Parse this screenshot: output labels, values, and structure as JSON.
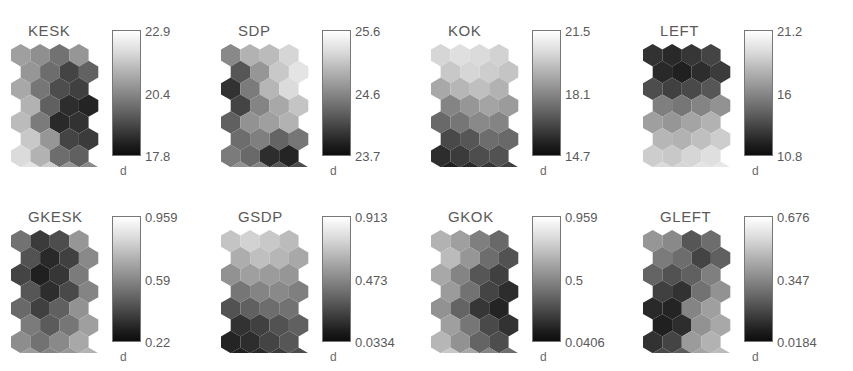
{
  "figure": {
    "type": "som-component-planes",
    "unit_label": "d",
    "colormap": "grayscale-inverted",
    "rows": 2,
    "cols": 4
  },
  "chart_data": {
    "type": "heatmap",
    "title": "",
    "xlabel": "",
    "ylabel": "",
    "colorbar_unit": "d",
    "colormap": "gray (high = light, low = dark)",
    "grid_shape": "hexagonal",
    "map_rows": 8,
    "map_cols": 4,
    "panels": [
      {
        "label": "KESK",
        "unit": "d",
        "ticks": [
          "22.9",
          "20.4",
          "17.8"
        ],
        "vmin": 17.8,
        "vmax": 22.9,
        "vmid": 20.4,
        "values": [
          [
            0.62,
            0.55,
            0.42,
            0.58
          ],
          [
            0.58,
            0.4,
            0.22,
            0.35
          ],
          [
            0.66,
            0.44,
            0.26,
            0.2
          ],
          [
            0.7,
            0.34,
            0.12,
            0.08
          ],
          [
            0.74,
            0.46,
            0.1,
            0.14
          ],
          [
            0.8,
            0.58,
            0.22,
            0.18
          ],
          [
            0.88,
            0.7,
            0.4,
            0.34
          ],
          [
            0.92,
            0.82,
            0.58,
            0.52
          ]
        ]
      },
      {
        "label": "SDP",
        "unit": "d",
        "ticks": [
          "25.6",
          "24.6",
          "23.7"
        ],
        "vmin": 23.7,
        "vmax": 25.6,
        "vmid": 24.6,
        "values": [
          [
            0.52,
            0.7,
            0.74,
            0.86
          ],
          [
            0.3,
            0.58,
            0.8,
            0.92
          ],
          [
            0.14,
            0.46,
            0.72,
            0.88
          ],
          [
            0.22,
            0.5,
            0.66,
            0.78
          ],
          [
            0.34,
            0.56,
            0.62,
            0.7
          ],
          [
            0.4,
            0.48,
            0.36,
            0.44
          ],
          [
            0.46,
            0.38,
            0.12,
            0.08
          ],
          [
            0.56,
            0.5,
            0.3,
            0.26
          ]
        ]
      },
      {
        "label": "KOK",
        "unit": "d",
        "ticks": [
          "21.5",
          "18.1",
          "14.7"
        ],
        "vmin": 14.7,
        "vmax": 21.5,
        "vmid": 18.1,
        "values": [
          [
            0.86,
            0.9,
            0.88,
            0.84
          ],
          [
            0.8,
            0.86,
            0.82,
            0.78
          ],
          [
            0.66,
            0.72,
            0.76,
            0.7
          ],
          [
            0.5,
            0.58,
            0.64,
            0.6
          ],
          [
            0.38,
            0.44,
            0.52,
            0.5
          ],
          [
            0.24,
            0.3,
            0.4,
            0.38
          ],
          [
            0.12,
            0.18,
            0.26,
            0.28
          ],
          [
            0.06,
            0.1,
            0.16,
            0.2
          ]
        ]
      },
      {
        "label": "LEFT",
        "unit": "d",
        "ticks": [
          "21.2",
          "16",
          "10.8"
        ],
        "vmin": 10.8,
        "vmax": 21.2,
        "vmid": 16,
        "values": [
          [
            0.14,
            0.1,
            0.16,
            0.22
          ],
          [
            0.1,
            0.06,
            0.12,
            0.18
          ],
          [
            0.26,
            0.2,
            0.24,
            0.3
          ],
          [
            0.48,
            0.44,
            0.5,
            0.56
          ],
          [
            0.62,
            0.58,
            0.64,
            0.7
          ],
          [
            0.72,
            0.7,
            0.76,
            0.82
          ],
          [
            0.82,
            0.8,
            0.86,
            0.9
          ],
          [
            0.88,
            0.86,
            0.92,
            0.94
          ]
        ]
      },
      {
        "label": "GKESK",
        "unit": "d",
        "ticks": [
          "0.959",
          "0.59",
          "0.22"
        ],
        "vmin": 0.22,
        "vmax": 0.959,
        "vmid": 0.59,
        "values": [
          [
            0.42,
            0.18,
            0.26,
            0.58
          ],
          [
            0.28,
            0.1,
            0.2,
            0.52
          ],
          [
            0.22,
            0.06,
            0.16,
            0.46
          ],
          [
            0.3,
            0.12,
            0.24,
            0.5
          ],
          [
            0.38,
            0.2,
            0.34,
            0.56
          ],
          [
            0.46,
            0.32,
            0.44,
            0.62
          ],
          [
            0.54,
            0.42,
            0.52,
            0.66
          ],
          [
            0.6,
            0.5,
            0.58,
            0.7
          ]
        ]
      },
      {
        "label": "GSDP",
        "unit": "d",
        "ticks": [
          "0.913",
          "0.473",
          "0.0334"
        ],
        "vmin": 0.0334,
        "vmax": 0.913,
        "vmid": 0.473,
        "values": [
          [
            0.78,
            0.84,
            0.8,
            0.74
          ],
          [
            0.68,
            0.76,
            0.72,
            0.66
          ],
          [
            0.56,
            0.62,
            0.6,
            0.58
          ],
          [
            0.44,
            0.5,
            0.52,
            0.48
          ],
          [
            0.28,
            0.34,
            0.4,
            0.42
          ],
          [
            0.14,
            0.2,
            0.28,
            0.34
          ],
          [
            0.08,
            0.12,
            0.22,
            0.3
          ],
          [
            0.06,
            0.1,
            0.18,
            0.26
          ]
        ]
      },
      {
        "label": "GKOK",
        "unit": "d",
        "ticks": [
          "0.959",
          "0.5",
          "0.0406"
        ],
        "vmin": 0.0406,
        "vmax": 0.959,
        "vmid": 0.5,
        "values": [
          [
            0.7,
            0.62,
            0.48,
            0.38
          ],
          [
            0.74,
            0.58,
            0.4,
            0.28
          ],
          [
            0.66,
            0.5,
            0.3,
            0.2
          ],
          [
            0.6,
            0.42,
            0.22,
            0.12
          ],
          [
            0.56,
            0.36,
            0.16,
            0.08
          ],
          [
            0.62,
            0.44,
            0.24,
            0.14
          ],
          [
            0.72,
            0.56,
            0.36,
            0.26
          ],
          [
            0.8,
            0.66,
            0.5,
            0.4
          ]
        ]
      },
      {
        "label": "GLEFT",
        "unit": "d",
        "ticks": [
          "0.676",
          "0.347",
          "0.0184"
        ],
        "vmin": 0.0184,
        "vmax": 0.676,
        "vmid": 0.347,
        "values": [
          [
            0.58,
            0.52,
            0.3,
            0.4
          ],
          [
            0.46,
            0.4,
            0.22,
            0.34
          ],
          [
            0.36,
            0.28,
            0.34,
            0.48
          ],
          [
            0.2,
            0.14,
            0.42,
            0.56
          ],
          [
            0.1,
            0.08,
            0.5,
            0.62
          ],
          [
            0.06,
            0.12,
            0.56,
            0.66
          ],
          [
            0.14,
            0.22,
            0.6,
            0.7
          ],
          [
            0.24,
            0.32,
            0.64,
            0.74
          ]
        ]
      }
    ]
  }
}
